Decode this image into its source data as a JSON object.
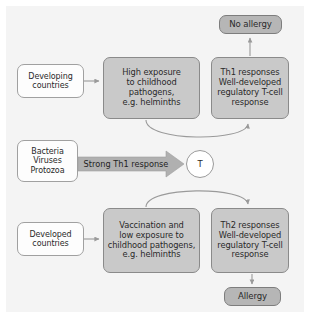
{
  "figure": {
    "background": "#f4f4f4",
    "colors": {
      "box_gray": "#c9c9c9",
      "box_dark_gray": "#b6b6b6",
      "box_white": "#fdfdfd",
      "border": "#8a8a8a",
      "arrow": "#9a9a9a",
      "band_arrow": "#b0b0b0",
      "text": "#2a2a2a"
    }
  },
  "nodes": {
    "developing_countries": {
      "label": "Developing\ncountries",
      "style": "white"
    },
    "high_exposure": {
      "label": "High exposure\nto childhood\npathogens,\ne.g. helminths",
      "style": "gray"
    },
    "th1_response": {
      "label": "Th1 responses\nWell-developed\nregulatory T-cell\nresponse",
      "style": "gray"
    },
    "no_allergy": {
      "label": "No allergy",
      "style": "dark"
    },
    "pathogen_sources": {
      "label": "Bacteria\nViruses\nProtozoa",
      "style": "white"
    },
    "t_cell": {
      "label": "T",
      "style": "circle"
    },
    "developed_countries": {
      "label": "Developed\ncountries",
      "style": "white"
    },
    "vaccination": {
      "label": "Vaccination and\nlow exposure to\nchildhood pathogens,\ne.g. helminths",
      "style": "gray"
    },
    "th2_response": {
      "label": "Th2 responses\nWell-developed\nregulatory T-cell\nresponse",
      "style": "gray"
    },
    "allergy": {
      "label": "Allergy",
      "style": "dark"
    }
  },
  "edges": {
    "strong_th1_label": "Strong Th1 response"
  }
}
